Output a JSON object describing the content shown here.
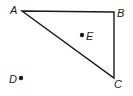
{
  "figure": {
    "stroke_color": "#1a1a1a",
    "points": {
      "A": {
        "label": "A",
        "x": 22,
        "y": 11
      },
      "B": {
        "label": "B",
        "x": 114,
        "y": 12
      },
      "C": {
        "label": "C",
        "x": 114,
        "y": 78
      },
      "D": {
        "label": "D",
        "x": 21,
        "y": 78
      },
      "E": {
        "label": "E",
        "x": 82,
        "y": 35
      }
    },
    "triangle": [
      "A",
      "B",
      "C"
    ],
    "isolated_points": [
      "D",
      "E"
    ]
  }
}
